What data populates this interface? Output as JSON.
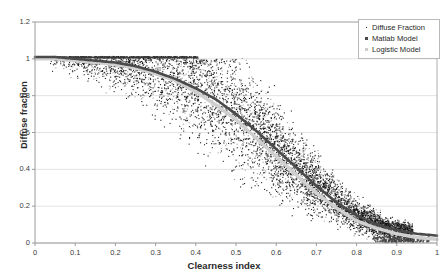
{
  "chart_data": {
    "type": "scatter",
    "title": "",
    "xlabel": "Clearness index",
    "ylabel": "Diffuse fraction",
    "xlim": [
      0,
      1
    ],
    "ylim": [
      0,
      1.2
    ],
    "grid": "horizontal",
    "legend_position": "top-right",
    "xticks": [
      "0",
      "0.1",
      "0.2",
      "0.3",
      "0.4",
      "0.5",
      "0.6",
      "0.7",
      "0.8",
      "0.9",
      "1"
    ],
    "xtick_values": [
      0,
      0.1,
      0.2,
      0.3,
      0.4,
      0.5,
      0.6,
      0.7,
      0.8,
      0.9,
      1
    ],
    "yticks": [
      "0",
      "0.2",
      "0.4",
      "0.6",
      "0.8",
      "1",
      "1.2"
    ],
    "ytick_values": [
      0,
      0.2,
      0.4,
      0.6,
      0.8,
      1,
      1.2
    ],
    "series": [
      {
        "name": "Diffuse Fraction",
        "type": "scatter",
        "marker": "dot",
        "color": "#111111",
        "n_points": 6000,
        "description": "Dense cloud of measured diffuse fraction versus clearness index; saturated near 1.0 for kt below 0.25, broad spread between kt 0.3 and 0.8, collapsing toward 0.05 above kt 0.85."
      },
      {
        "name": "Matlab Model",
        "type": "line",
        "marker": "square",
        "color": "#4a4a4a",
        "x": [
          0.0,
          0.05,
          0.1,
          0.15,
          0.2,
          0.25,
          0.3,
          0.35,
          0.4,
          0.45,
          0.5,
          0.55,
          0.6,
          0.65,
          0.7,
          0.75,
          0.8,
          0.85,
          0.9,
          0.95,
          1.0
        ],
        "y": [
          1.01,
          1.01,
          1.0,
          0.99,
          0.98,
          0.96,
          0.93,
          0.89,
          0.84,
          0.78,
          0.7,
          0.61,
          0.51,
          0.41,
          0.31,
          0.22,
          0.15,
          0.1,
          0.07,
          0.05,
          0.04
        ]
      },
      {
        "name": "Logistic Model",
        "type": "line",
        "marker": "line",
        "color": "#cfcfcf",
        "x": [
          0.0,
          0.05,
          0.1,
          0.15,
          0.2,
          0.25,
          0.3,
          0.35,
          0.4,
          0.45,
          0.5,
          0.55,
          0.6,
          0.65,
          0.7,
          0.75,
          0.8,
          0.85,
          0.9,
          0.95,
          1.0
        ],
        "y": [
          1.0,
          1.0,
          0.99,
          0.98,
          0.97,
          0.95,
          0.92,
          0.88,
          0.82,
          0.75,
          0.67,
          0.57,
          0.47,
          0.37,
          0.27,
          0.19,
          0.12,
          0.08,
          0.05,
          0.03,
          0.02
        ]
      }
    ]
  },
  "legend": {
    "items": [
      {
        "label": "Diffuse Fraction",
        "swatch": "dot-marker-icon"
      },
      {
        "label": "Matlab Model",
        "swatch": "square-marker-icon"
      },
      {
        "label": "Logistic Model",
        "swatch": "line-marker-icon"
      }
    ]
  },
  "colors": {
    "scatter": "#111111",
    "matlab_curve": "#4a4a4a",
    "logistic_curve": "#cfcfcf",
    "axis": "#9a9a9a",
    "grid": "#e2e2e2",
    "text": "#2b2b2b"
  }
}
